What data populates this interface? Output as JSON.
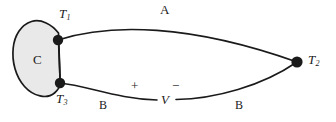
{
  "figure": {
    "type": "thermocouple-circuit-diagram",
    "background_color": "#ffffff",
    "line_color": "#1a1a1a",
    "body_fill_color": "#e9e9e9",
    "body_stroke_color": "#1a1a1a"
  },
  "labels": {
    "body": "C",
    "junction_1": "T",
    "junction_1_sub": "1",
    "junction_2": "T",
    "junction_2_sub": "2",
    "junction_3": "T",
    "junction_3_sub": "3",
    "wire_a": "A",
    "wire_b_left": "B",
    "wire_b_right": "B",
    "voltmeter": "V",
    "polarity_positive": "+",
    "polarity_negative": "−"
  },
  "nodes": [
    {
      "id": "T1",
      "label": "T1",
      "cx": 58,
      "cy": 40,
      "r": 5.2
    },
    {
      "id": "T3",
      "label": "T3",
      "cx": 60,
      "cy": 83,
      "r": 5.2
    },
    {
      "id": "T2",
      "label": "T2",
      "cx": 297,
      "cy": 62,
      "r": 5.6
    }
  ],
  "segments": [
    {
      "id": "wire-a",
      "material": "A",
      "from": "T1",
      "to": "T2"
    },
    {
      "id": "wire-b-left",
      "material": "B",
      "from": "T3",
      "to": "voltmeter-plus"
    },
    {
      "id": "wire-b-right",
      "material": "B",
      "from": "voltmeter-minus",
      "to": "T2"
    }
  ]
}
